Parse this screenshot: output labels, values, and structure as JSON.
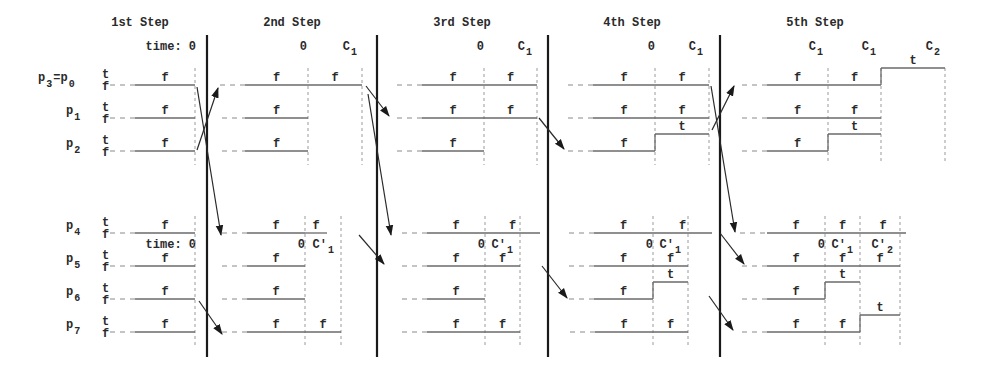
{
  "diagram": {
    "width": 999,
    "height": 377,
    "colors": {
      "signal": "#6a6a6a",
      "separator": "#1a1a1a",
      "text": "#2a2a2a",
      "dashed": "#8a8a8a"
    },
    "steps": [
      {
        "title": "1st Step",
        "title_x": 140
      },
      {
        "title": "2nd Step",
        "title_x": 292
      },
      {
        "title": "3rd Step",
        "title_x": 462
      },
      {
        "title": "4th Step",
        "title_x": 632
      },
      {
        "title": "5th Step",
        "title_x": 815
      }
    ],
    "separators_x": [
      207,
      377,
      548,
      720
    ],
    "separator_y": [
      35,
      357
    ],
    "groups": [
      {
        "name": "top",
        "time_labels": [
          {
            "text": "time: 0",
            "x": 196,
            "sub": ""
          },
          {
            "text": "0",
            "x": 307,
            "sub": ""
          },
          {
            "text": "C",
            "x": 357,
            "sub": "1"
          },
          {
            "text": "0",
            "x": 484,
            "sub": ""
          },
          {
            "text": "C",
            "x": 532,
            "sub": "1"
          },
          {
            "text": "0",
            "x": 655,
            "sub": ""
          },
          {
            "text": "C",
            "x": 703,
            "sub": "1"
          },
          {
            "text": "C",
            "x": 823,
            "sub": "1"
          },
          {
            "text": "C",
            "x": 876,
            "sub": "1"
          },
          {
            "text": "C",
            "x": 940,
            "sub": "2"
          }
        ],
        "time_label_y": 50,
        "vmarkers": [
          {
            "x": 195,
            "y1": 68,
            "y2": 165
          },
          {
            "x": 308,
            "y1": 68,
            "y2": 165
          },
          {
            "x": 362,
            "y1": 68,
            "y2": 165
          },
          {
            "x": 484,
            "y1": 68,
            "y2": 165
          },
          {
            "x": 537,
            "y1": 68,
            "y2": 165
          },
          {
            "x": 655,
            "y1": 68,
            "y2": 165
          },
          {
            "x": 709,
            "y1": 68,
            "y2": 165
          },
          {
            "x": 828,
            "y1": 68,
            "y2": 162
          },
          {
            "x": 881,
            "y1": 68,
            "y2": 162
          },
          {
            "x": 945,
            "y1": 68,
            "y2": 162
          }
        ],
        "processes": [
          {
            "label": "p",
            "sub": "3",
            "label2": "=p",
            "sub2": "0",
            "y": 85
          },
          {
            "label": "p",
            "sub": "1",
            "label2": "",
            "sub2": "",
            "y": 118
          },
          {
            "label": "p",
            "sub": "2",
            "label2": "",
            "sub2": "",
            "y": 151
          }
        ]
      },
      {
        "name": "bottom",
        "time_labels": [
          {
            "text": "time: 0",
            "x": 196,
            "sub": ""
          },
          {
            "text": "0",
            "x": 305,
            "sub": ""
          },
          {
            "text": "C′",
            "x": 334,
            "sub": "1"
          },
          {
            "text": "0",
            "x": 485,
            "sub": ""
          },
          {
            "text": "C′",
            "x": 513,
            "sub": "1"
          },
          {
            "text": "0",
            "x": 653,
            "sub": ""
          },
          {
            "text": "C′",
            "x": 681,
            "sub": "1"
          },
          {
            "text": "0",
            "x": 825,
            "sub": ""
          },
          {
            "text": "C′",
            "x": 853,
            "sub": "1"
          },
          {
            "text": "C′",
            "x": 893,
            "sub": "2"
          }
        ],
        "time_label_y": 248,
        "vmarkers": [
          {
            "x": 195,
            "y1": 216,
            "y2": 345
          },
          {
            "x": 305,
            "y1": 216,
            "y2": 345
          },
          {
            "x": 341,
            "y1": 216,
            "y2": 345
          },
          {
            "x": 485,
            "y1": 216,
            "y2": 345
          },
          {
            "x": 520,
            "y1": 216,
            "y2": 345
          },
          {
            "x": 653,
            "y1": 216,
            "y2": 345
          },
          {
            "x": 688,
            "y1": 216,
            "y2": 345
          },
          {
            "x": 825,
            "y1": 216,
            "y2": 345
          },
          {
            "x": 860,
            "y1": 216,
            "y2": 345
          },
          {
            "x": 900,
            "y1": 216,
            "y2": 345
          }
        ],
        "processes": [
          {
            "label": "p",
            "sub": "4",
            "label2": "",
            "sub2": "",
            "y": 233
          },
          {
            "label": "p",
            "sub": "5",
            "label2": "",
            "sub2": "",
            "y": 266
          },
          {
            "label": "p",
            "sub": "6",
            "label2": "",
            "sub2": "",
            "y": 299
          },
          {
            "label": "p",
            "sub": "7",
            "label2": "",
            "sub2": "",
            "y": 332
          }
        ]
      }
    ],
    "level_labels": {
      "true": "t",
      "false": "f",
      "x": 102
    },
    "timelines": [
      {
        "row": "p3=p0",
        "y": 85,
        "dash": [
          110,
          135
        ],
        "segs": [
          [
            135,
            195,
            "f"
          ]
        ]
      },
      {
        "row": "p1",
        "y": 118,
        "dash": [
          110,
          135
        ],
        "segs": [
          [
            135,
            195,
            "f"
          ]
        ]
      },
      {
        "row": "p2",
        "y": 151,
        "dash": [
          110,
          135
        ],
        "segs": [
          [
            135,
            195,
            "f"
          ]
        ]
      },
      {
        "row": "p4",
        "y": 233,
        "dash": [
          110,
          135
        ],
        "segs": [
          [
            135,
            195,
            "f"
          ]
        ]
      },
      {
        "row": "p5",
        "y": 266,
        "dash": [
          110,
          135
        ],
        "segs": [
          [
            135,
            195,
            "f"
          ]
        ]
      },
      {
        "row": "p6",
        "y": 299,
        "dash": [
          110,
          135
        ],
        "segs": [
          [
            135,
            195,
            "f"
          ]
        ]
      },
      {
        "row": "p7",
        "y": 332,
        "dash": [
          110,
          135
        ],
        "segs": [
          [
            135,
            195,
            "f"
          ]
        ]
      },
      {
        "row": "s2-r1",
        "y": 85,
        "dash": [
          220,
          245
        ],
        "segs": [
          [
            245,
            308,
            "f"
          ],
          [
            308,
            362,
            "f"
          ]
        ]
      },
      {
        "row": "s2-r2",
        "y": 118,
        "dash": [
          222,
          245
        ],
        "segs": [
          [
            245,
            308,
            "f"
          ]
        ]
      },
      {
        "row": "s2-r3",
        "y": 151,
        "dash": [
          222,
          245
        ],
        "segs": [
          [
            245,
            308,
            "f"
          ]
        ]
      },
      {
        "row": "s2-b1",
        "y": 233,
        "dash": [
          222,
          247
        ],
        "segs": [
          [
            247,
            305,
            "f"
          ],
          [
            305,
            327,
            "f"
          ]
        ]
      },
      {
        "row": "s2-b2",
        "y": 266,
        "dash": [
          222,
          247
        ],
        "segs": [
          [
            247,
            305,
            "f"
          ]
        ]
      },
      {
        "row": "s2-b3",
        "y": 299,
        "dash": [
          222,
          247
        ],
        "segs": [
          [
            247,
            305,
            "f"
          ]
        ]
      },
      {
        "row": "s2-b4",
        "y": 332,
        "dash": [
          222,
          247
        ],
        "segs": [
          [
            247,
            305,
            "f"
          ],
          [
            305,
            341,
            "f"
          ]
        ]
      },
      {
        "row": "s3-r1",
        "y": 85,
        "dash": [
          397,
          422
        ],
        "segs": [
          [
            422,
            484,
            "f"
          ],
          [
            484,
            537,
            "f"
          ]
        ]
      },
      {
        "row": "s3-r2",
        "y": 118,
        "dash": [
          397,
          422
        ],
        "segs": [
          [
            422,
            484,
            "f"
          ],
          [
            484,
            537,
            "f"
          ]
        ]
      },
      {
        "row": "s3-r3",
        "y": 151,
        "dash": [
          397,
          422
        ],
        "segs": [
          [
            422,
            484,
            "f"
          ]
        ]
      },
      {
        "row": "s3-b1",
        "y": 233,
        "dash": [
          402,
          427
        ],
        "segs": [
          [
            427,
            485,
            "f"
          ],
          [
            485,
            540,
            "f"
          ]
        ]
      },
      {
        "row": "s3-b2",
        "y": 266,
        "dash": [
          402,
          427
        ],
        "segs": [
          [
            427,
            485,
            "f"
          ],
          [
            485,
            520,
            "f"
          ]
        ]
      },
      {
        "row": "s3-b3",
        "y": 299,
        "dash": [
          402,
          427
        ],
        "segs": [
          [
            427,
            485,
            "f"
          ]
        ]
      },
      {
        "row": "s3-b4",
        "y": 332,
        "dash": [
          402,
          427
        ],
        "segs": [
          [
            427,
            485,
            "f"
          ],
          [
            485,
            520,
            "f"
          ]
        ]
      },
      {
        "row": "s4-r1",
        "y": 85,
        "dash": [
          568,
          593
        ],
        "segs": [
          [
            593,
            655,
            "f"
          ],
          [
            655,
            709,
            "f"
          ]
        ]
      },
      {
        "row": "s4-r2",
        "y": 118,
        "dash": [
          568,
          593
        ],
        "segs": [
          [
            593,
            655,
            "f"
          ],
          [
            655,
            709,
            "f"
          ]
        ]
      },
      {
        "row": "s4-r3",
        "y": 151,
        "dash": [
          568,
          593
        ],
        "segs": [
          [
            593,
            655,
            "f"
          ],
          [
            655,
            709,
            "t"
          ]
        ]
      },
      {
        "row": "s4-b1",
        "y": 233,
        "dash": [
          569,
          594
        ],
        "segs": [
          [
            594,
            653,
            "f"
          ],
          [
            653,
            712,
            "f"
          ]
        ]
      },
      {
        "row": "s4-b2",
        "y": 266,
        "dash": [
          569,
          594
        ],
        "segs": [
          [
            594,
            653,
            "f"
          ],
          [
            653,
            688,
            "f"
          ]
        ]
      },
      {
        "row": "s4-b3",
        "y": 299,
        "dash": [
          569,
          594
        ],
        "segs": [
          [
            594,
            653,
            "f"
          ],
          [
            653,
            688,
            "t"
          ]
        ]
      },
      {
        "row": "s4-b4",
        "y": 332,
        "dash": [
          570,
          595
        ],
        "segs": [
          [
            595,
            653,
            "f"
          ],
          [
            653,
            688,
            "f"
          ]
        ]
      },
      {
        "row": "s5-r1",
        "y": 85,
        "dash": [
          742,
          767
        ],
        "segs": [
          [
            767,
            828,
            "f"
          ],
          [
            828,
            881,
            "f"
          ],
          [
            881,
            945,
            "t"
          ]
        ]
      },
      {
        "row": "s5-r2",
        "y": 118,
        "dash": [
          742,
          767
        ],
        "segs": [
          [
            767,
            828,
            "f"
          ],
          [
            828,
            881,
            "f"
          ]
        ]
      },
      {
        "row": "s5-r3",
        "y": 151,
        "dash": [
          742,
          767
        ],
        "segs": [
          [
            767,
            828,
            "f"
          ],
          [
            828,
            881,
            "t"
          ]
        ]
      },
      {
        "row": "s5-b1",
        "y": 233,
        "dash": [
          740,
          767
        ],
        "segs": [
          [
            767,
            825,
            "f"
          ],
          [
            825,
            860,
            "f"
          ],
          [
            860,
            906,
            "f"
          ]
        ]
      },
      {
        "row": "s5-b2",
        "y": 266,
        "dash": [
          742,
          767
        ],
        "segs": [
          [
            767,
            825,
            "f"
          ],
          [
            825,
            860,
            "f"
          ],
          [
            860,
            900,
            "f"
          ]
        ]
      },
      {
        "row": "s5-b3",
        "y": 299,
        "dash": [
          742,
          767
        ],
        "segs": [
          [
            767,
            825,
            "f"
          ],
          [
            825,
            860,
            "t"
          ]
        ]
      },
      {
        "row": "s5-b4",
        "y": 332,
        "dash": [
          742,
          767
        ],
        "segs": [
          [
            767,
            825,
            "f"
          ],
          [
            825,
            860,
            "f"
          ],
          [
            860,
            900,
            "t"
          ]
        ]
      }
    ],
    "arrows": [
      {
        "x1": 197,
        "y1": 87,
        "x2": 221,
        "y2": 235,
        "head": true
      },
      {
        "x1": 197,
        "y1": 150,
        "x2": 218,
        "y2": 88,
        "head": true
      },
      {
        "x1": 199,
        "y1": 301,
        "x2": 222,
        "y2": 334,
        "head": true
      },
      {
        "x1": 366,
        "y1": 86,
        "x2": 389,
        "y2": 116,
        "head": true
      },
      {
        "x1": 368,
        "y1": 94,
        "x2": 391,
        "y2": 235,
        "head": true
      },
      {
        "x1": 359,
        "y1": 235,
        "x2": 384,
        "y2": 264,
        "head": true
      },
      {
        "x1": 539,
        "y1": 118,
        "x2": 564,
        "y2": 149,
        "head": true
      },
      {
        "x1": 542,
        "y1": 266,
        "x2": 567,
        "y2": 298,
        "head": true
      },
      {
        "x1": 711,
        "y1": 86,
        "x2": 735,
        "y2": 232,
        "head": true
      },
      {
        "x1": 712,
        "y1": 130,
        "x2": 734,
        "y2": 86,
        "head": true
      },
      {
        "x1": 720,
        "y1": 233,
        "x2": 744,
        "y2": 264,
        "head": true
      },
      {
        "x1": 709,
        "y1": 296,
        "x2": 733,
        "y2": 330,
        "head": true
      }
    ]
  }
}
